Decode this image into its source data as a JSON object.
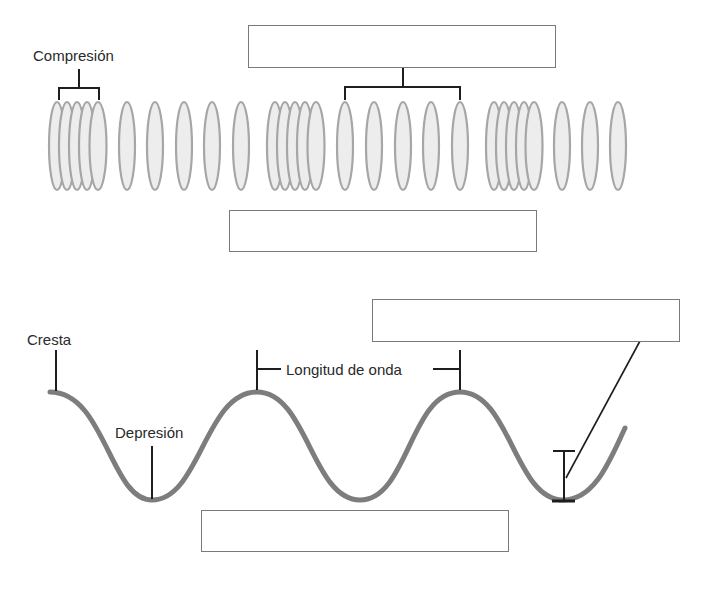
{
  "colors": {
    "ellipse_fill": "#ededed",
    "ellipse_stroke": "#a6a6a6",
    "wave_stroke": "#7d7d7d",
    "line": "#1e1e1e",
    "box_border": "#7a7a7a",
    "text": "#2a2a2a"
  },
  "longitudinal_wave": {
    "labels": {
      "compression": "Compresión"
    },
    "answer_boxes": [
      {
        "id": "rarefaction-answer",
        "value": ""
      },
      {
        "id": "longitudinal-wave-answer",
        "value": ""
      }
    ],
    "ellipse_groups": [
      {
        "type": "compression",
        "count": 5
      },
      {
        "type": "rarefaction",
        "count": 5
      },
      {
        "type": "compression",
        "count": 5
      },
      {
        "type": "rarefaction",
        "count": 5
      },
      {
        "type": "compression",
        "count": 5
      },
      {
        "type": "rarefaction",
        "count": 3
      }
    ]
  },
  "transverse_wave": {
    "labels": {
      "crest": "Cresta",
      "trough": "Depresión",
      "wavelength": "Longitud de onda"
    },
    "answer_boxes": [
      {
        "id": "amplitude-answer",
        "value": ""
      },
      {
        "id": "transverse-wave-answer",
        "value": ""
      }
    ]
  }
}
